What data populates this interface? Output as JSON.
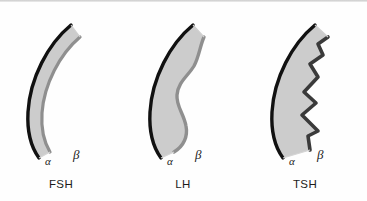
{
  "figure": {
    "title": "",
    "background_color": "#fefefe",
    "subunit_body_color": "#cccccc",
    "alpha_edge_color": "#111111",
    "beta_edge_color": "#8f8f8f",
    "beta_edge_color_dark": "#3a3a3a",
    "label_color": "#1c1c1c"
  },
  "panels": [
    {
      "id": "fsh",
      "name": "FSH",
      "label": "FSH",
      "alpha_label": "α",
      "beta_label": "β",
      "beta_edge_style": "smooth",
      "beta_edge_color": "#8f8f8f",
      "left": 0,
      "alpha_pos": {
        "x": 45,
        "y": 156
      },
      "beta_pos": {
        "x": 73,
        "y": 148
      },
      "label_y": 178
    },
    {
      "id": "lh",
      "name": "LH",
      "label": "LH",
      "alpha_label": "α",
      "beta_label": "β",
      "beta_edge_style": "wavy",
      "beta_edge_color": "#8f8f8f",
      "left": 122,
      "alpha_pos": {
        "x": 45,
        "y": 156
      },
      "beta_pos": {
        "x": 73,
        "y": 148
      },
      "label_y": 178
    },
    {
      "id": "tsh",
      "name": "TSH",
      "label": "TSH",
      "alpha_label": "α",
      "beta_label": "β",
      "beta_edge_style": "zigzag",
      "beta_edge_color": "#3a3a3a",
      "left": 244,
      "alpha_pos": {
        "x": 45,
        "y": 156
      },
      "beta_pos": {
        "x": 73,
        "y": 148
      },
      "label_y": 178
    }
  ]
}
